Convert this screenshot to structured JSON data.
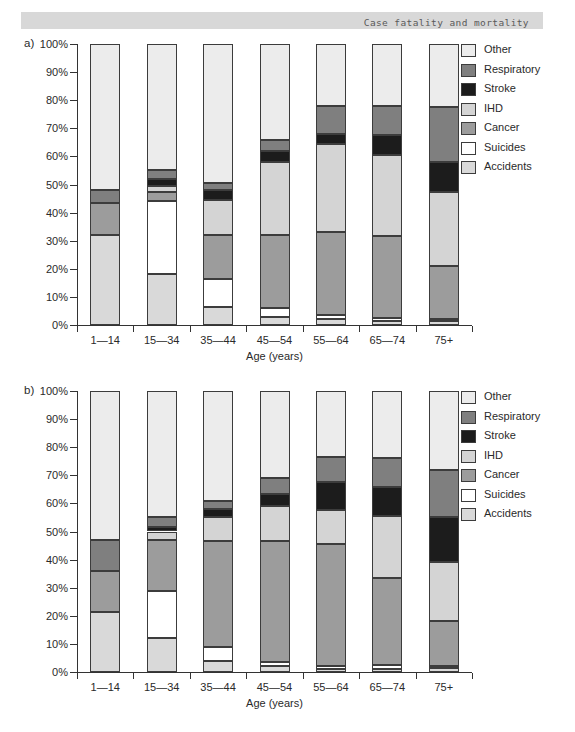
{
  "header": {
    "title": "Case fatality and mortality"
  },
  "legend": [
    "Other",
    "Respiratory",
    "Stroke",
    "IHD",
    "Cancer",
    "Suicides",
    "Accidents"
  ],
  "colors": {
    "Other": "#ececec",
    "Respiratory": "#7f7f7f",
    "Stroke": "#1c1c1c",
    "IHD": "#d4d4d4",
    "Cancer": "#9c9c9c",
    "Suicides": "#ffffff",
    "Accidents": "#d9d9d9",
    "segment_border": "#3c3c3c",
    "axis": "#333333",
    "header_bg": "#d8d8d8",
    "header_text": "#5a5a5a"
  },
  "axis": {
    "y_tick_labels": [
      "0%",
      "10%",
      "20%",
      "30%",
      "40%",
      "50%",
      "60%",
      "70%",
      "80%",
      "90%",
      "100%"
    ],
    "x_title": "Age (years)"
  },
  "chart_data": [
    {
      "id": "a",
      "panel_label": "a)",
      "type": "bar",
      "stacked": true,
      "percent": true,
      "ylim": [
        0,
        100
      ],
      "xlabel": "Age (years)",
      "categories": [
        "1—14",
        "15—34",
        "35—44",
        "45—54",
        "55—64",
        "65—74",
        "75+"
      ],
      "series": [
        {
          "name": "Accidents",
          "values": [
            32,
            18,
            6.5,
            3,
            2,
            1.5,
            1.5
          ]
        },
        {
          "name": "Suicides",
          "values": [
            0,
            26,
            10,
            3,
            1.5,
            1,
            0.5
          ]
        },
        {
          "name": "Cancer",
          "values": [
            11.5,
            3.5,
            15.5,
            26,
            29.5,
            29,
            19
          ]
        },
        {
          "name": "IHD",
          "values": [
            0,
            2,
            12.5,
            26,
            31.5,
            29,
            26.5
          ]
        },
        {
          "name": "Stroke",
          "values": [
            0,
            2.5,
            3.5,
            4,
            3.5,
            7,
            10.5
          ]
        },
        {
          "name": "Respiratory",
          "values": [
            4.5,
            3,
            2.5,
            4,
            10,
            10.5,
            19.5
          ]
        },
        {
          "name": "Other",
          "values": [
            52,
            45,
            49.5,
            34,
            22,
            22,
            22.5
          ]
        }
      ]
    },
    {
      "id": "b",
      "panel_label": "b)",
      "type": "bar",
      "stacked": true,
      "percent": true,
      "ylim": [
        0,
        100
      ],
      "xlabel": "Age (years)",
      "categories": [
        "1—14",
        "15—34",
        "35—44",
        "45—54",
        "55—64",
        "65—74",
        "75+"
      ],
      "series": [
        {
          "name": "Accidents",
          "values": [
            21.5,
            12,
            4,
            2,
            1,
            1,
            1.5
          ]
        },
        {
          "name": "Suicides",
          "values": [
            0,
            17,
            5,
            1.5,
            1,
            1.5,
            0.5
          ]
        },
        {
          "name": "Cancer",
          "values": [
            14.5,
            18,
            37.5,
            43,
            43.5,
            31,
            16
          ]
        },
        {
          "name": "IHD",
          "values": [
            0,
            3,
            8.5,
            12.5,
            12,
            22,
            21
          ]
        },
        {
          "name": "Stroke",
          "values": [
            0,
            1.5,
            3,
            4.5,
            10,
            10.5,
            16
          ]
        },
        {
          "name": "Respiratory",
          "values": [
            11,
            3.5,
            3,
            5.5,
            9,
            10,
            17
          ]
        },
        {
          "name": "Other",
          "values": [
            53,
            45,
            39,
            31,
            23.5,
            24,
            28
          ]
        }
      ]
    }
  ]
}
